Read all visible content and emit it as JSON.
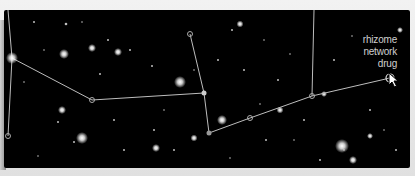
{
  "scene": {
    "title": "star constellation network map",
    "background_color": "#000000",
    "frame_color": "#e6e6e6",
    "line_color": "#bdbdbd",
    "label_color": "#cfcfcf"
  },
  "tooltip": {
    "line1": "rhizome",
    "line2": "network",
    "line3": "drug"
  },
  "nodes": [
    {
      "id": "a",
      "x": 8,
      "y": 48,
      "bright": true
    },
    {
      "id": "b",
      "x": 4,
      "y": 126
    },
    {
      "id": "c",
      "x": 88,
      "y": 90
    },
    {
      "id": "d",
      "x": 200,
      "y": 83
    },
    {
      "id": "e",
      "x": 186,
      "y": 24
    },
    {
      "id": "f",
      "x": 205,
      "y": 123
    },
    {
      "id": "g",
      "x": 246,
      "y": 108
    },
    {
      "id": "h",
      "x": 308,
      "y": 86
    },
    {
      "id": "i",
      "x": 386,
      "y": 68,
      "selected": true
    }
  ],
  "cursor": {
    "icon": "arrow-pointer-icon"
  }
}
